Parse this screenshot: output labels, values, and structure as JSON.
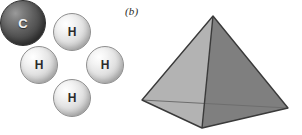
{
  "figure": {
    "background_color": "#ffffff",
    "width": 302,
    "height": 135
  },
  "panels": [
    {
      "id": "a",
      "label": "(a)",
      "caption_style": "italic-parenthesized-letter",
      "subject": "methane-ball-model",
      "atoms": [
        {
          "element": "H",
          "label": "H",
          "position": "top",
          "color": "#e2e2e2",
          "label_color": "#2b2b2b"
        },
        {
          "element": "H",
          "label": "H",
          "position": "left",
          "color": "#e2e2e2",
          "label_color": "#2b2b2b"
        },
        {
          "element": "C",
          "label": "C",
          "position": "center",
          "color": "#4a4a4a",
          "label_color": "#f2f2f2"
        },
        {
          "element": "H",
          "label": "H",
          "position": "right",
          "color": "#e2e2e2",
          "label_color": "#2b2b2b"
        },
        {
          "element": "H",
          "label": "H",
          "position": "bottom",
          "color": "#e2e2e2",
          "label_color": "#2b2b2b"
        }
      ]
    },
    {
      "id": "b",
      "label": "(b)",
      "caption_style": "italic-parenthesized-letter",
      "subject": "tetrahedron",
      "faces": [
        {
          "name": "left-front-face",
          "color": "#b3b3b3"
        },
        {
          "name": "right-front-face",
          "color": "#7f7f7f"
        },
        {
          "name": "bottom-left-face",
          "color": "#a8a8a8"
        },
        {
          "name": "bottom-right-face",
          "color": "#8c8c8c"
        }
      ],
      "edges": {
        "visible_color": "#3a3a3a",
        "hidden_color": "#6e6e6e",
        "hidden_style": "thin-line"
      },
      "vertices": {
        "apex": {
          "x": 73,
          "y": 16
        },
        "left": {
          "x": 2,
          "y": 100
        },
        "right": {
          "x": 148,
          "y": 108
        },
        "front_bottom": {
          "x": 62,
          "y": 128
        }
      }
    }
  ]
}
